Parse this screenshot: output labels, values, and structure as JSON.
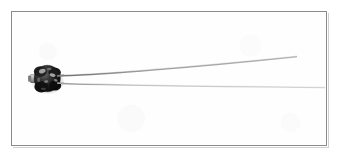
{
  "image": {
    "kind": "photograph",
    "subject_label": "bead thermistor with two wire leads",
    "background_color": "#ffffff",
    "frame": {
      "border_color": "#888a8c",
      "fill_color": "#ffffff",
      "x": 11,
      "y": 11,
      "width": 316,
      "height": 135
    },
    "component": {
      "name": "black epoxy bead sensor",
      "body_color": "#1a1a1a",
      "highlight_color": "#c9c9c9",
      "center_x": 46,
      "center_y": 78,
      "radius_x": 13,
      "radius_y": 13,
      "stub": {
        "name": "left metal stub",
        "color": "#9a9a9a",
        "x": 29,
        "y": 74,
        "width": 9,
        "height": 9
      }
    },
    "leads": [
      {
        "name": "upper-lead",
        "color": "#9b9ea1",
        "start_x": 60,
        "start_y": 75,
        "end_x": 297,
        "end_y": 56,
        "thickness": 1.6
      },
      {
        "name": "lower-lead",
        "color": "#c3c6c8",
        "start_x": 60,
        "start_y": 83,
        "end_x": 326,
        "end_y": 87,
        "thickness": 1.4
      }
    ]
  }
}
